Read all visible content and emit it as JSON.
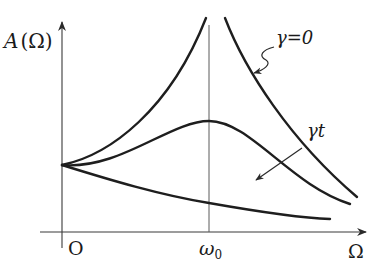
{
  "diagram": {
    "type": "resonance-amplitude-plot",
    "y_axis_label": {
      "symbol": "A",
      "argument": "(Ω)"
    },
    "x_axis_label": "Ω",
    "origin_label": "O",
    "resonance_tick_label": {
      "symbol": "ω",
      "subscript": "0"
    },
    "annotations": {
      "undamped_label": "γ=0",
      "damping_direction_label": "γt"
    },
    "curves": [
      {
        "name": "undamped",
        "description": "diverges at ω0 (γ=0)"
      },
      {
        "name": "damped-peak",
        "description": "finite peak at ω0"
      },
      {
        "name": "overdamped",
        "description": "monotonically decreasing"
      }
    ],
    "colors": {
      "curve": "#1e1e1e",
      "axis": "#3a3a3a",
      "background": "#ffffff"
    }
  }
}
